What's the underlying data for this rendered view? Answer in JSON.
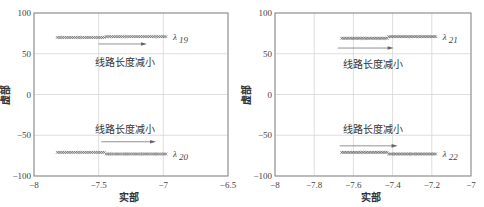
{
  "chart_data": [
    {
      "type": "scatter",
      "title": "",
      "xlabel": "实部",
      "ylabel": "虚部",
      "xlim": [
        -8,
        -6.5
      ],
      "ylim": [
        -100,
        100
      ],
      "xticks": [
        -8,
        -7.5,
        -7,
        -6.5
      ],
      "xtick_labels": [
        "−8",
        "−7.5",
        "−7",
        "−6.5"
      ],
      "yticks": [
        100,
        50,
        0,
        -50,
        -100
      ],
      "ytick_labels": [
        "100",
        "50",
        "0",
        "−50",
        "−100"
      ],
      "grid": true,
      "series": [
        {
          "name": "λ19",
          "label": "λ",
          "sub": "19",
          "x_start": -7.82,
          "x_end": -6.98,
          "x_step": -7.45,
          "y_start": 70,
          "y_end": 71
        },
        {
          "name": "λ20",
          "label": "λ",
          "sub": "20",
          "x_start": -7.82,
          "x_end": -6.98,
          "x_step": -7.45,
          "y_start": -71,
          "y_end": -73
        }
      ],
      "annotations": [
        {
          "text": "线路长度减小",
          "x": -7.3,
          "y": 40,
          "arrow_x0": -7.5,
          "arrow_x1": -7.15,
          "arrow_y": 62
        },
        {
          "text": "线路长度减小",
          "x": -7.3,
          "y": -42,
          "arrow_x0": -7.48,
          "arrow_x1": -7.08,
          "arrow_y": -58
        }
      ]
    },
    {
      "type": "scatter",
      "title": "",
      "xlabel": "实部",
      "ylabel": "虚部",
      "xlim": [
        -8,
        -7
      ],
      "ylim": [
        -100,
        100
      ],
      "xticks": [
        -8,
        -7.8,
        -7.6,
        -7.4,
        -7.2,
        -7
      ],
      "xtick_labels": [
        "−8",
        "−7.8",
        "−7.6",
        "−7.4",
        "−7.2",
        "−7"
      ],
      "yticks": [
        100,
        50,
        0,
        -50,
        -100
      ],
      "ytick_labels": [
        "100",
        "50",
        "0",
        "−50",
        "−100"
      ],
      "grid": true,
      "series": [
        {
          "name": "λ21",
          "label": "λ",
          "sub": "21",
          "x_start": -7.66,
          "x_end": -7.18,
          "x_step": -7.42,
          "y_start": 69,
          "y_end": 71
        },
        {
          "name": "λ22",
          "label": "λ",
          "sub": "22",
          "x_start": -7.66,
          "x_end": -7.18,
          "x_step": -7.42,
          "y_start": -71,
          "y_end": -73
        }
      ],
      "annotations": [
        {
          "text": "线路长度减小",
          "x": -7.5,
          "y": 38,
          "arrow_x0": -7.68,
          "arrow_x1": -7.41,
          "arrow_y": 57
        },
        {
          "text": "线路长度减小",
          "x": -7.5,
          "y": -42,
          "arrow_x0": -7.67,
          "arrow_x1": -7.39,
          "arrow_y": -63
        }
      ]
    }
  ]
}
